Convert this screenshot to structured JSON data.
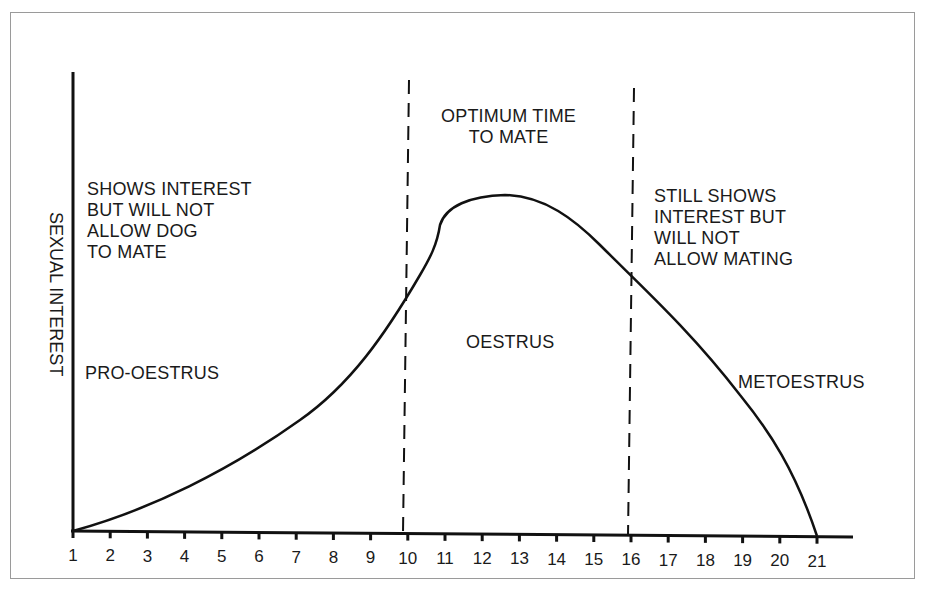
{
  "chart_data": {
    "type": "line",
    "title": "",
    "xlabel": "",
    "ylabel": "SEXUAL INTEREST",
    "x": [
      1,
      2,
      3,
      4,
      5,
      6,
      7,
      8,
      9,
      10,
      11,
      12,
      13,
      14,
      15,
      16,
      17,
      18,
      19,
      20,
      21
    ],
    "series": [
      {
        "name": "Sexual interest",
        "values": [
          0,
          3,
          7,
          11,
          16,
          21,
          27,
          34,
          42,
          52,
          62,
          69,
          70,
          66,
          60,
          52,
          42,
          32,
          21,
          11,
          0
        ]
      }
    ],
    "xlim": [
      1,
      21
    ],
    "ylim": [
      0,
      100
    ],
    "grid": false,
    "legend": "none",
    "dividers": [
      10,
      16
    ],
    "annotations": [
      {
        "text": "SHOWS INTEREST\nBUT WILL NOT\nALLOW DOG\nTO MATE",
        "region": "pro-oestrus"
      },
      {
        "text": "PRO-OESTRUS",
        "region": "pro-oestrus"
      },
      {
        "text": "OPTIMUM TIME\nTO MATE",
        "region": "oestrus"
      },
      {
        "text": "OESTRUS",
        "region": "oestrus"
      },
      {
        "text": "STILL SHOWS\nINTEREST BUT\nWILL NOT\nALLOW MATING",
        "region": "metoestrus"
      },
      {
        "text": "METOESTRUS",
        "region": "metoestrus"
      }
    ]
  },
  "axis": {
    "y_label": "SEXUAL INTEREST",
    "x_ticks": [
      "1",
      "2",
      "3",
      "4",
      "5",
      "6",
      "7",
      "8",
      "9",
      "10",
      "11",
      "12",
      "13",
      "14",
      "15",
      "16",
      "17",
      "18",
      "19",
      "20",
      "21"
    ]
  },
  "labels": {
    "pro_note": "SHOWS INTEREST\nBUT WILL NOT\nALLOW DOG\nTO MATE",
    "pro_phase": "PRO-OESTRUS",
    "optimum": "OPTIMUM TIME\nTO MATE",
    "oestrus_phase": "OESTRUS",
    "met_note": "STILL SHOWS\nINTEREST BUT\nWILL NOT\nALLOW MATING",
    "met_phase": "METOESTRUS"
  }
}
